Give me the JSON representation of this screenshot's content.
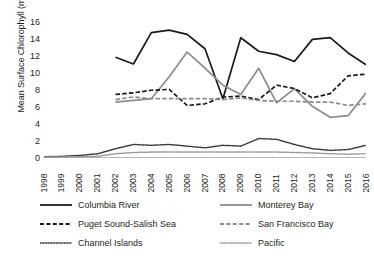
{
  "chart_data": {
    "type": "line",
    "title": "",
    "xlabel": "",
    "ylabel": "Mean Surface Chlorophyll (mg m",
    "ylabel_sup": "-3",
    "ylabel_close": ")",
    "x": [
      1998,
      1999,
      2000,
      2001,
      2002,
      2003,
      2004,
      2005,
      2006,
      2007,
      2008,
      2009,
      2010,
      2011,
      2012,
      2013,
      2014,
      2015,
      2016
    ],
    "xticklabels": [
      "1998",
      "1999",
      "2000",
      "2001",
      "2002",
      "2003",
      "2004",
      "2005",
      "2006",
      "2007",
      "2008",
      "2009",
      "2010",
      "2011",
      "2012",
      "2013",
      "2014",
      "2015",
      "2016"
    ],
    "yticks": [
      0,
      2,
      4,
      6,
      8,
      10,
      12,
      14,
      16
    ],
    "yticklabels": [
      "0",
      "2",
      "4",
      "6",
      "8",
      "10",
      "12",
      "14",
      "16"
    ],
    "ylim": [
      0,
      17
    ],
    "xlim": [
      1998,
      2016
    ],
    "grid": false,
    "legend_position": "below",
    "series": [
      {
        "name": "Columbia River",
        "color": "#1a1a1a",
        "style": "solid",
        "x": [
          2002,
          2003,
          2004,
          2005,
          2006,
          2007,
          2008,
          2009,
          2010,
          2011,
          2012,
          2013,
          2014,
          2015,
          2016
        ],
        "values": [
          11.9,
          11.1,
          14.8,
          15.1,
          14.6,
          12.9,
          7.0,
          14.2,
          12.6,
          12.2,
          11.4,
          14.0,
          14.2,
          12.4,
          11.0
        ]
      },
      {
        "name": "Monterey Bay",
        "color": "#8c8c8c",
        "style": "solid",
        "x": [
          2002,
          2003,
          2004,
          2005,
          2006,
          2007,
          2008,
          2009,
          2010,
          2011,
          2012,
          2013,
          2014,
          2015,
          2016
        ],
        "values": [
          6.6,
          6.8,
          7.0,
          9.6,
          12.5,
          10.6,
          8.6,
          7.5,
          10.6,
          6.5,
          8.2,
          6.1,
          4.8,
          5.0,
          7.7
        ]
      },
      {
        "name": "Puget Sound-Salish Sea",
        "color": "#1a1a1a",
        "style": "dashed",
        "x": [
          2002,
          2003,
          2004,
          2005,
          2006,
          2007,
          2008,
          2009,
          2010,
          2011,
          2012,
          2013,
          2014,
          2015,
          2016
        ],
        "values": [
          7.5,
          7.7,
          8.0,
          8.1,
          6.2,
          6.4,
          7.2,
          7.3,
          6.9,
          8.6,
          8.2,
          7.1,
          7.6,
          9.7,
          9.9
        ]
      },
      {
        "name": "San Francisco Bay",
        "color": "#8c8c8c",
        "style": "dashed",
        "x": [
          2002,
          2003,
          2004,
          2005,
          2006,
          2007,
          2008,
          2009,
          2010,
          2011,
          2012,
          2013,
          2014,
          2015,
          2016
        ],
        "values": [
          6.9,
          7.2,
          7.0,
          7.0,
          7.0,
          7.0,
          6.9,
          7.1,
          6.8,
          6.7,
          6.7,
          6.6,
          6.6,
          6.2,
          6.4
        ]
      },
      {
        "name": "Channel Islands",
        "color": "#3a3a3a",
        "style": "dotted",
        "x": [
          1998,
          1999,
          2000,
          2001,
          2002,
          2003,
          2004,
          2005,
          2006,
          2007,
          2008,
          2009,
          2010,
          2011,
          2012,
          2013,
          2014,
          2015,
          2016
        ],
        "values": [
          0.15,
          0.2,
          0.3,
          0.5,
          1.1,
          1.6,
          1.5,
          1.6,
          1.4,
          1.2,
          1.5,
          1.4,
          2.3,
          2.2,
          1.6,
          1.1,
          0.9,
          1.0,
          1.5
        ]
      },
      {
        "name": "Pacific",
        "color": "#9a9a9a",
        "style": "dotted",
        "x": [
          1998,
          1999,
          2000,
          2001,
          2002,
          2003,
          2004,
          2005,
          2006,
          2007,
          2008,
          2009,
          2010,
          2011,
          2012,
          2013,
          2014,
          2015,
          2016
        ],
        "values": [
          0.1,
          0.12,
          0.15,
          0.2,
          0.5,
          0.65,
          0.7,
          0.7,
          0.7,
          0.7,
          0.7,
          0.7,
          0.7,
          0.7,
          0.65,
          0.6,
          0.5,
          0.45,
          0.5
        ]
      }
    ]
  },
  "legend": {
    "entries": [
      {
        "label": "Columbia River",
        "color": "#1a1a1a",
        "style": "solid"
      },
      {
        "label": "Monterey Bay",
        "color": "#8c8c8c",
        "style": "solid"
      },
      {
        "label": "Puget Sound-Salish Sea",
        "color": "#1a1a1a",
        "style": "dashed"
      },
      {
        "label": "San Francisco Bay",
        "color": "#8c8c8c",
        "style": "dashed"
      },
      {
        "label": "Channel Islands",
        "color": "#3a3a3a",
        "style": "dotted"
      },
      {
        "label": "Pacific",
        "color": "#9a9a9a",
        "style": "dotted"
      }
    ]
  }
}
